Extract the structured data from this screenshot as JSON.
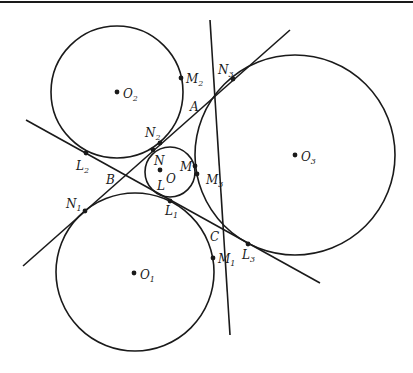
{
  "diagram": {
    "ink_color": "#1a1a1a",
    "background": "#ffffff",
    "top_border": {
      "y": 2
    },
    "circles": [
      {
        "id": "O",
        "cx": 170,
        "cy": 172,
        "r": 25
      },
      {
        "id": "O1",
        "cx": 135,
        "cy": 272,
        "r": 79
      },
      {
        "id": "O2",
        "cx": 117,
        "cy": 92,
        "r": 66
      },
      {
        "id": "O3",
        "cx": 295,
        "cy": 155,
        "r": 100
      }
    ],
    "lines": [
      {
        "id": "line-M2-M1",
        "x1": 210,
        "y1": 20,
        "x2": 230,
        "y2": 335
      },
      {
        "id": "line-N3-N1",
        "x1": 290,
        "y1": 30,
        "x2": 23,
        "y2": 266
      },
      {
        "id": "line-L2-L3",
        "x1": 26,
        "y1": 120,
        "x2": 320,
        "y2": 283
      }
    ],
    "points": [
      {
        "name": "O",
        "x": 160,
        "y": 170,
        "label": "O",
        "sub": "",
        "lx": 166,
        "ly": 183
      },
      {
        "name": "O1",
        "x": 134,
        "y": 273,
        "label": "O",
        "sub": "1",
        "lx": 140,
        "ly": 279
      },
      {
        "name": "O2",
        "x": 117,
        "y": 92,
        "label": "O",
        "sub": "2",
        "lx": 123,
        "ly": 98
      },
      {
        "name": "O3",
        "x": 295,
        "y": 155,
        "label": "O",
        "sub": "3",
        "lx": 301,
        "ly": 161
      },
      {
        "name": "M",
        "x": 195,
        "y": 166,
        "label": "M",
        "sub": "",
        "lx": 180,
        "ly": 171
      },
      {
        "name": "M1",
        "x": 213,
        "y": 258,
        "label": "M",
        "sub": "1",
        "lx": 218,
        "ly": 263
      },
      {
        "name": "M2",
        "x": 181,
        "y": 78,
        "label": "M",
        "sub": "2",
        "lx": 186,
        "ly": 83
      },
      {
        "name": "M3",
        "x": 197,
        "y": 174,
        "label": "M",
        "sub": "3",
        "lx": 206,
        "ly": 184
      },
      {
        "name": "N",
        "x": 153,
        "y": 150,
        "label": "N",
        "sub": "",
        "lx": 154,
        "ly": 165
      },
      {
        "name": "N1",
        "x": 85,
        "y": 211,
        "label": "N",
        "sub": "1",
        "lx": 66,
        "ly": 208
      },
      {
        "name": "N2",
        "x": 160,
        "y": 143,
        "label": "N",
        "sub": "2",
        "lx": 145,
        "ly": 137
      },
      {
        "name": "N3",
        "x": 233,
        "y": 79,
        "label": "N",
        "sub": "3",
        "lx": 218,
        "ly": 74
      },
      {
        "name": "L",
        "x": 0,
        "y": 0,
        "label": "L",
        "sub": "",
        "lx": 157,
        "ly": 190,
        "nodot": true
      },
      {
        "name": "L1",
        "x": 170,
        "y": 201,
        "label": "L",
        "sub": "1",
        "lx": 165,
        "ly": 215
      },
      {
        "name": "L2",
        "x": 86,
        "y": 153,
        "label": "L",
        "sub": "2",
        "lx": 76,
        "ly": 170
      },
      {
        "name": "L3",
        "x": 248,
        "y": 244,
        "label": "L",
        "sub": "3",
        "lx": 242,
        "ly": 259
      },
      {
        "name": "A",
        "x": 0,
        "y": 0,
        "label": "A",
        "sub": "",
        "lx": 190,
        "ly": 111,
        "nodot": true
      },
      {
        "name": "B",
        "x": 0,
        "y": 0,
        "label": "B",
        "sub": "",
        "lx": 106,
        "ly": 184,
        "nodot": true
      },
      {
        "name": "C",
        "x": 0,
        "y": 0,
        "label": "C",
        "sub": "",
        "lx": 210,
        "ly": 241,
        "nodot": true
      }
    ]
  }
}
